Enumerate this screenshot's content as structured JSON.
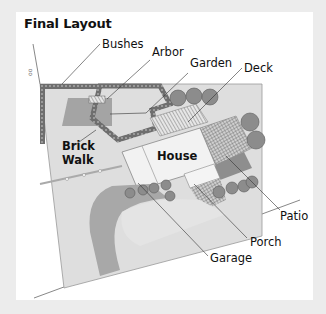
{
  "title": "Final Layout",
  "labels": {
    "bushes": "Bushes",
    "arbor": "Arbor",
    "garden": "Garden",
    "deck": "Deck",
    "brick_walk_1": "Brick",
    "brick_walk_2": "Walk",
    "house": "House",
    "patio": "Patio",
    "porch": "Porch",
    "garage": "Garage"
  },
  "colors": {
    "outer_bg": "#ececec",
    "panel_bg": "#ffffff",
    "lawn": "#dcdcdc",
    "driveway": "#a8a8a8",
    "garden_bed": "#9a9a9a",
    "brick": "#6e6e6e",
    "tree": "#8c8c8c",
    "house": "#f2f2f2",
    "leader_line": "#333333"
  }
}
